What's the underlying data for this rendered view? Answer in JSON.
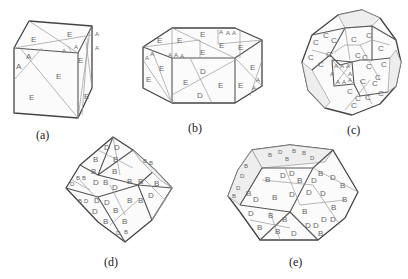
{
  "figure": {
    "panels": [
      {
        "id": "a",
        "caption": "(a)",
        "shape": "cube",
        "face_labels": [
          "E",
          "E",
          "A",
          "A",
          "A",
          "A",
          "E",
          "E",
          "A",
          "A",
          "E",
          "E",
          "E"
        ]
      },
      {
        "id": "b",
        "caption": "(b)",
        "shape": "hexagonal-prism",
        "face_labels": [
          "E",
          "E",
          "E",
          "A",
          "A",
          "A",
          "A",
          "A",
          "A",
          "A",
          "A",
          "E",
          "E",
          "E",
          "E",
          "E",
          "E",
          "D",
          "E",
          "D",
          "E",
          "E",
          "E",
          "A",
          "A"
        ]
      },
      {
        "id": "c",
        "caption": "(c)",
        "shape": "truncated-polyhedron",
        "face_labels": [
          "C",
          "C",
          "C",
          "C",
          "C",
          "C",
          "C",
          "C",
          "C",
          "C",
          "C",
          "C",
          "C",
          "C",
          "C",
          "A",
          "A",
          "A",
          "A",
          "A",
          "A",
          "A",
          "A",
          "C",
          "C",
          "C",
          "C",
          "C",
          "C",
          "C"
        ]
      },
      {
        "id": "d",
        "caption": "(d)",
        "shape": "rhombic-polyhedron",
        "face_labels": [
          "D",
          "D",
          "B",
          "B",
          "B",
          "B",
          "B",
          "B",
          "B",
          "B",
          "D",
          "D",
          "B",
          "B",
          "D",
          "D",
          "B",
          "B",
          "B",
          "D",
          "D",
          "D",
          "D",
          "B",
          "B",
          "B",
          "B",
          "B",
          "B",
          "B",
          "B",
          "D",
          "D"
        ]
      },
      {
        "id": "e",
        "caption": "(e)",
        "shape": "truncated-octahedron-like",
        "face_labels": [
          "B",
          "D",
          "D",
          "B",
          "B",
          "D",
          "D",
          "B",
          "B",
          "D",
          "B",
          "D",
          "D",
          "D",
          "B",
          "B",
          "B",
          "D",
          "B",
          "B",
          "D",
          "D",
          "B",
          "D",
          "D",
          "B",
          "B",
          "D",
          "B",
          "D",
          "B",
          "B",
          "B",
          "D",
          "D",
          "D",
          "B",
          "B"
        ]
      }
    ]
  }
}
